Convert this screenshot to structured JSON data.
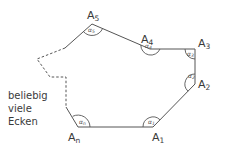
{
  "diagram": {
    "type": "polygon-with-angles",
    "stroke_color": "#555555",
    "vertices": [
      {
        "name": "A",
        "sub": "1",
        "x": 153,
        "y": 127,
        "angle": "α",
        "angle_sub": "1"
      },
      {
        "name": "A",
        "sub": "2",
        "x": 195,
        "y": 84,
        "angle": "α",
        "angle_sub": "2"
      },
      {
        "name": "A",
        "sub": "3",
        "x": 195,
        "y": 49,
        "angle": "α",
        "angle_sub": "3"
      },
      {
        "name": "A",
        "sub": "4",
        "x": 150,
        "y": 49,
        "angle": "α",
        "angle_sub": "4"
      },
      {
        "name": "A",
        "sub": "5",
        "x": 92,
        "y": 24,
        "angle": "α",
        "angle_sub": "5"
      },
      {
        "name": "A",
        "sub": "n",
        "x": 78,
        "y": 127,
        "angle": "α",
        "angle_sub": "n"
      }
    ],
    "note_lines": [
      "beliebig",
      "viele",
      "Ecken"
    ]
  }
}
